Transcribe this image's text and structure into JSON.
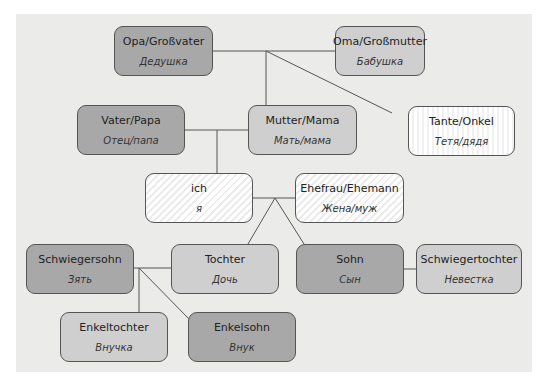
{
  "diagram": {
    "type": "family-tree",
    "colors": {
      "panel_background": "#ebebea",
      "dark_box": "#a8a8a8",
      "medium_box": "#cfcfcf",
      "light_box": "#ffffff",
      "border": "#555555",
      "line": "#555555"
    },
    "nodes": {
      "opa": {
        "de": "Opa/Großvater",
        "ru": "Дедушка"
      },
      "oma": {
        "de": "Oma/Großmutter",
        "ru": "Бабушка"
      },
      "vater": {
        "de": "Vater/Papa",
        "ru": "Отец/папа"
      },
      "mutter": {
        "de": "Mutter/Mama",
        "ru": "Мать/мама"
      },
      "tante": {
        "de": "Tante/Onkel",
        "ru": "Тетя/дядя"
      },
      "ich": {
        "de": "ich",
        "ru": "я"
      },
      "ehefrau": {
        "de": "Ehefrau/Ehemann",
        "ru": "Жена/муж"
      },
      "schwiegersohn": {
        "de": "Schwiegersohn",
        "ru": "Зять"
      },
      "tochter": {
        "de": "Tochter",
        "ru": "Дочь"
      },
      "sohn": {
        "de": "Sohn",
        "ru": "Сын"
      },
      "schwiegertochter": {
        "de": "Schwiegertochter",
        "ru": "Невестка"
      },
      "enkeltochter": {
        "de": "Enkeltochter",
        "ru": "Внучка"
      },
      "enkelsohn": {
        "de": "Enkelsohn",
        "ru": "Внук"
      }
    },
    "edges": [
      [
        "opa",
        "oma"
      ],
      [
        "opa+oma",
        "mutter"
      ],
      [
        "opa+oma",
        "tante"
      ],
      [
        "vater",
        "mutter"
      ],
      [
        "vater+mutter",
        "ich"
      ],
      [
        "ich",
        "ehefrau"
      ],
      [
        "ich+ehefrau",
        "tochter"
      ],
      [
        "ich+ehefrau",
        "sohn"
      ],
      [
        "sohn",
        "schwiegertochter"
      ],
      [
        "schwiegersohn",
        "tochter"
      ],
      [
        "schwiegersohn+tochter",
        "enkeltochter"
      ],
      [
        "schwiegersohn+tochter",
        "enkelsohn"
      ]
    ]
  }
}
